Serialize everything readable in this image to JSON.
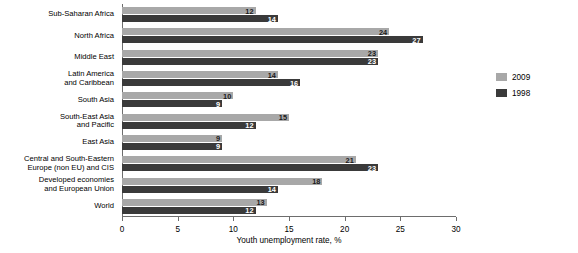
{
  "chart_data": {
    "type": "bar",
    "orientation": "horizontal",
    "title": "",
    "xlabel": "Youth unemployment rate, %",
    "ylabel": "",
    "xlim": [
      0,
      30
    ],
    "xticks": [
      0,
      5,
      10,
      15,
      20,
      25,
      30
    ],
    "grid": false,
    "legend_position": "right",
    "categories": [
      "Sub-Saharan Africa",
      "North Africa",
      "Middle East",
      "Latin America\nand Caribbean",
      "South Asia",
      "South-East Asia\nand Pacific",
      "East Asia",
      "Central and South-Eastern\nEurope (non EU) and CIS",
      "Developed economies\nand European Union",
      "World"
    ],
    "series": [
      {
        "name": "2009",
        "color": "#a8a8a8",
        "values": [
          12,
          24,
          23,
          14,
          10,
          15,
          9,
          21,
          18,
          13
        ]
      },
      {
        "name": "1998",
        "color": "#3a3a3a",
        "values": [
          14,
          27,
          23,
          16,
          9,
          12,
          9,
          23,
          14,
          12
        ]
      }
    ]
  },
  "legend": {
    "entries": [
      {
        "label": "2009"
      },
      {
        "label": "1998"
      }
    ]
  }
}
